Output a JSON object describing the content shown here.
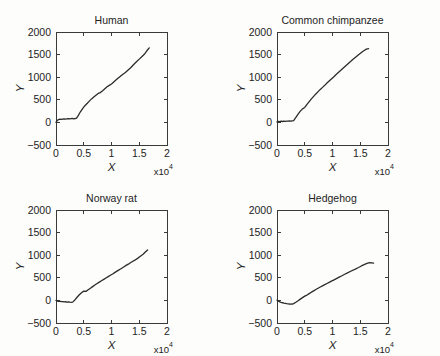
{
  "figure": {
    "background": "#fdfdfb",
    "line_color": "#2b2b2b",
    "axis_color": "#3a3a3a",
    "panel_count": 4
  },
  "chart_data": {
    "type": "line",
    "title": "",
    "layout": "2x2 grid of line plots",
    "shared": {
      "xlabel": "X",
      "ylabel": "Y",
      "xlim": [
        0,
        20000
      ],
      "ylim": [
        -500,
        2000
      ],
      "xticks": [
        0,
        5000,
        10000,
        15000,
        20000
      ],
      "xticklabels": [
        "0",
        "0.5",
        "1",
        "1.5",
        "2"
      ],
      "yticks": [
        -500,
        0,
        500,
        1000,
        1500,
        2000
      ],
      "yticklabels": [
        "-500",
        "0",
        "500",
        "1000",
        "1500",
        "2000"
      ],
      "x_multiplier_label": "x10",
      "x_multiplier_exponent": "4",
      "grid": false,
      "legend": "none"
    },
    "panels": [
      {
        "title": "Human",
        "position": "top-left",
        "x": [
          0,
          200,
          450,
          700,
          950,
          1200,
          1450,
          1700,
          1950,
          2200,
          2450,
          2700,
          2950,
          3200,
          3450,
          3700,
          4000,
          4400,
          4800,
          5200,
          5600,
          6000,
          6400,
          6800,
          7200,
          7600,
          8000,
          8400,
          8800,
          9200,
          9600,
          10000,
          10500,
          11000,
          11500,
          12000,
          12500,
          13000,
          13500,
          14000,
          14500,
          15000,
          15500,
          16000,
          16400,
          16800
        ],
        "y": [
          0,
          40,
          62,
          70,
          66,
          74,
          80,
          72,
          78,
          84,
          76,
          82,
          88,
          80,
          86,
          95,
          150,
          235,
          305,
          370,
          420,
          470,
          520,
          560,
          600,
          640,
          660,
          700,
          745,
          790,
          820,
          850,
          905,
          960,
          1010,
          1060,
          1105,
          1160,
          1215,
          1280,
          1340,
          1400,
          1460,
          1520,
          1590,
          1650
        ]
      },
      {
        "title": "Common chimpanzee",
        "position": "top-right",
        "x": [
          0,
          250,
          500,
          750,
          1000,
          1250,
          1500,
          1750,
          2000,
          2250,
          2500,
          2750,
          3000,
          3400,
          3800,
          4200,
          4600,
          5000,
          5400,
          5800,
          6200,
          6600,
          7000,
          7400,
          7800,
          8200,
          8600,
          9000,
          9400,
          9800,
          10200,
          10700,
          11200,
          11700,
          12200,
          12700,
          13200,
          13700,
          14200,
          14700,
          15200,
          15700,
          16100,
          16500
        ],
        "y": [
          10,
          22,
          18,
          26,
          20,
          28,
          24,
          30,
          26,
          32,
          28,
          34,
          40,
          110,
          185,
          250,
          300,
          330,
          400,
          460,
          520,
          575,
          630,
          680,
          730,
          775,
          820,
          870,
          915,
          960,
          1005,
          1065,
          1120,
          1175,
          1230,
          1285,
          1340,
          1395,
          1445,
          1495,
          1545,
          1590,
          1620,
          1630
        ]
      },
      {
        "title": "Norway rat",
        "position": "bottom-left",
        "x": [
          0,
          250,
          500,
          750,
          1000,
          1250,
          1500,
          1750,
          2000,
          2250,
          2500,
          2750,
          3000,
          3400,
          3800,
          4200,
          4600,
          5000,
          5400,
          5800,
          6200,
          6600,
          7000,
          7400,
          7800,
          8200,
          8600,
          9000,
          9400,
          9800,
          10200,
          10700,
          11200,
          11700,
          12200,
          12700,
          13200,
          13700,
          14200,
          14700,
          15200,
          15700,
          16100,
          16500
        ],
        "y": [
          0,
          -15,
          -22,
          -20,
          -28,
          -25,
          -32,
          -30,
          -36,
          -34,
          -40,
          -42,
          -38,
          10,
          70,
          125,
          170,
          205,
          200,
          235,
          270,
          305,
          340,
          375,
          405,
          435,
          465,
          495,
          525,
          555,
          585,
          625,
          665,
          700,
          740,
          780,
          815,
          855,
          890,
          930,
          975,
          1020,
          1070,
          1115
        ]
      },
      {
        "title": "Hedgehog",
        "position": "bottom-right",
        "x": [
          0,
          250,
          500,
          750,
          1000,
          1250,
          1500,
          1750,
          2000,
          2250,
          2500,
          2750,
          3000,
          3400,
          3800,
          4200,
          4600,
          5000,
          5400,
          5800,
          6200,
          6600,
          7000,
          7400,
          7800,
          8200,
          8600,
          9000,
          9400,
          9800,
          10200,
          10700,
          11200,
          11700,
          12200,
          12700,
          13200,
          13700,
          14200,
          14700,
          15200,
          15700,
          16200,
          16700,
          17100,
          17400
        ],
        "y": [
          5,
          -18,
          -32,
          -44,
          -52,
          -60,
          -66,
          -72,
          -76,
          -80,
          -82,
          -80,
          -72,
          -42,
          -8,
          28,
          62,
          95,
          118,
          150,
          182,
          212,
          240,
          268,
          296,
          322,
          348,
          374,
          400,
          425,
          450,
          482,
          515,
          545,
          578,
          608,
          640,
          668,
          698,
          728,
          762,
          790,
          818,
          835,
          832,
          825
        ]
      }
    ]
  }
}
